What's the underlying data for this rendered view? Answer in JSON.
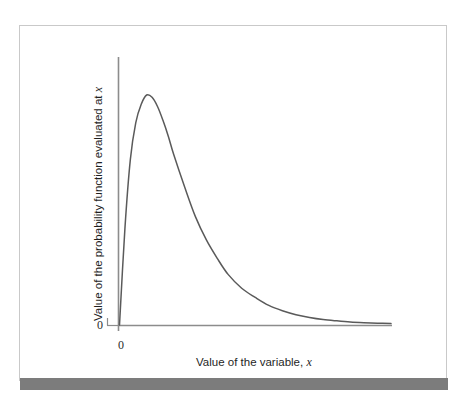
{
  "figure": {
    "background_color": "#ffffff",
    "frame_border_color": "#c9c9c9",
    "footer_rule_color": "#7c7c7c",
    "curve_color": "#5a5a5a",
    "axis_color": "#8c8c8c"
  },
  "axes": {
    "y_zero_label": "0",
    "x_zero_label": "0",
    "y_title_prefix": "Value of the probability function evaluated at ",
    "y_title_variable": "x",
    "x_title_prefix": "Value of the variable, ",
    "x_title_variable": "x"
  },
  "chart_data": {
    "type": "line",
    "title": "",
    "subtitle": "",
    "xlabel": "Value of the variable, x",
    "ylabel": "Value of the probability function evaluated at x",
    "grid": false,
    "legend": "none",
    "xlim": [
      0,
      10
    ],
    "ylim": [
      0,
      1
    ],
    "xticks": [
      0
    ],
    "xticklabels": [
      "0"
    ],
    "yticks": [
      0
    ],
    "yticklabels": [
      "0"
    ],
    "annotations": [],
    "series": [
      {
        "name": "probability density",
        "x": [
          0.0,
          0.2,
          0.4,
          0.6,
          0.8,
          1.0,
          1.2,
          1.4,
          1.6,
          1.8,
          2.0,
          2.4,
          2.8,
          3.2,
          3.6,
          4.0,
          4.5,
          5.0,
          5.5,
          6.0,
          6.5,
          7.0,
          7.5,
          8.0,
          8.5,
          9.0,
          9.5,
          10.0
        ],
        "y": [
          0.0,
          0.42,
          0.72,
          0.88,
          0.96,
          1.0,
          0.99,
          0.95,
          0.89,
          0.82,
          0.74,
          0.6,
          0.47,
          0.37,
          0.29,
          0.22,
          0.16,
          0.12,
          0.085,
          0.062,
          0.045,
          0.033,
          0.024,
          0.018,
          0.013,
          0.01,
          0.008,
          0.006
        ]
      }
    ],
    "peak": {
      "x": 1.05,
      "y": 1.0
    }
  }
}
